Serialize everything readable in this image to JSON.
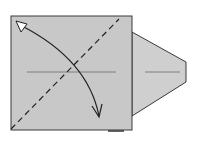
{
  "diagram": {
    "type": "origami-step",
    "colors": {
      "paper": "#c8c8c8",
      "outline": "#3a3a3a",
      "crease": "#6a6a6a",
      "arrow": "#222222",
      "background": "#ffffff"
    },
    "elements": [
      {
        "id": "square-flap",
        "shape": "square"
      },
      {
        "id": "trapezoid-point",
        "shape": "trapezoid"
      },
      {
        "id": "diagonal-valley-fold",
        "line": "dashed"
      },
      {
        "id": "horizontal-crease",
        "line": "solid-thin"
      },
      {
        "id": "fold-unfold-arrow",
        "arrow": "curved, white head at top-left, open head at bottom"
      }
    ]
  }
}
